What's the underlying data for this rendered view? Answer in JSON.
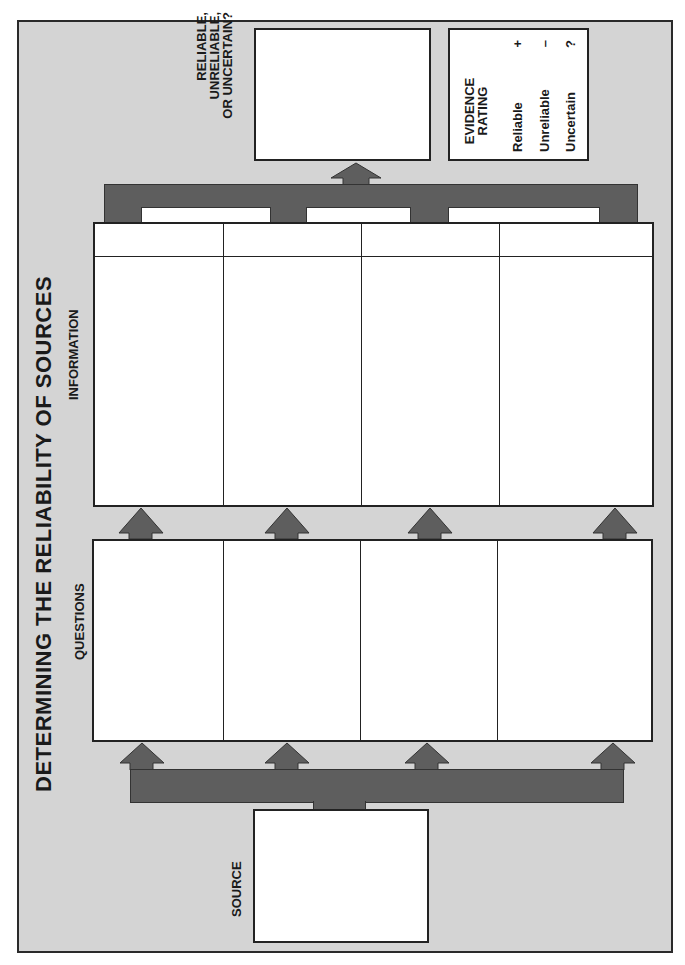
{
  "title": "DETERMINING THE RELIABILITY OF SOURCES",
  "sections": {
    "source": {
      "label": "SOURCE"
    },
    "questions": {
      "label": "QUESTIONS",
      "columns": 4
    },
    "information": {
      "label": "INFORMATION",
      "columns": 4
    },
    "verdict": {
      "label_lines": [
        "RELIABLE,",
        "UNRELIABLE,",
        "OR UNCERTAIN?"
      ]
    }
  },
  "evidence_rating": {
    "heading_lines": [
      "EVIDENCE",
      "RATING"
    ],
    "items": [
      {
        "label": "Reliable",
        "symbol": "+"
      },
      {
        "label": "Unreliable",
        "symbol": "–"
      },
      {
        "label": "Uncertain",
        "symbol": "?"
      }
    ]
  },
  "colors": {
    "background": "#d4d4d4",
    "arrow": "#5e5e5e",
    "border": "#222222",
    "box": "#ffffff"
  }
}
